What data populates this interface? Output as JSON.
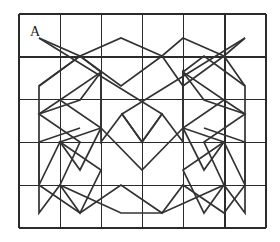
{
  "figure": {
    "type": "geometric-star-tessellation",
    "label_a": "A",
    "colors": {
      "grid": "#2b2b2b",
      "path": "#333333",
      "background": "#ffffff",
      "label": "#1a1a1a"
    },
    "grid": {
      "columns": 6,
      "rows": 5,
      "x0": 19,
      "y0": 14,
      "x1": 266,
      "y1": 228,
      "cell_width": 41.17,
      "cell_height": 42.8,
      "x_lines": [
        19,
        60.2,
        101.3,
        142.5,
        183.7,
        224.8,
        266
      ],
      "y_lines": [
        14,
        56.8,
        99.6,
        142.4,
        185.2,
        228
      ]
    },
    "label_a_position": {
      "x": 30,
      "y": 36
    },
    "paths": [
      {
        "name": "outer-zigzag-band-upper",
        "points": "39,38 101,72 142,56 183,72 245,38 245,86 204,100 245,114 224,142 204,128 204,170 163,142 142,170 121,142 80,170 80,128 60,142 39,114 80,100 39,86"
      }
    ],
    "polylines": [
      {
        "name": "stroke-1",
        "points": [
          [
            39,
            38
          ],
          [
            162,
            114
          ],
          [
            142,
            142
          ],
          [
            122,
            114
          ],
          [
            101,
            142
          ],
          [
            101,
            72
          ],
          [
            60,
            100
          ],
          [
            101,
            128
          ],
          [
            80,
            170
          ],
          [
            60,
            142
          ],
          [
            39,
            185
          ],
          [
            39,
            86
          ],
          [
            80,
            56
          ],
          [
            101,
            72
          ]
        ]
      },
      {
        "name": "stroke-2",
        "points": [
          [
            245,
            38
          ],
          [
            122,
            114
          ],
          [
            142,
            142
          ],
          [
            162,
            114
          ],
          [
            183,
            142
          ],
          [
            183,
            72
          ],
          [
            224,
            100
          ],
          [
            183,
            128
          ],
          [
            204,
            170
          ],
          [
            224,
            142
          ],
          [
            245,
            185
          ],
          [
            245,
            86
          ],
          [
            204,
            56
          ],
          [
            183,
            72
          ]
        ]
      },
      {
        "name": "stroke-3",
        "points": [
          [
            39,
            38
          ],
          [
            80,
            56
          ],
          [
            121,
            38
          ],
          [
            162,
            56
          ],
          [
            183,
            38
          ],
          [
            224,
            56
          ],
          [
            245,
            38
          ]
        ]
      },
      {
        "name": "stroke-4",
        "points": [
          [
            39,
            86
          ],
          [
            80,
            56
          ],
          [
            121,
            86
          ],
          [
            162,
            56
          ],
          [
            183,
            86
          ],
          [
            224,
            56
          ],
          [
            245,
            86
          ]
        ]
      },
      {
        "name": "stroke-5",
        "points": [
          [
            39,
            185
          ],
          [
            80,
            213
          ],
          [
            121,
            185
          ],
          [
            162,
            213
          ],
          [
            183,
            185
          ],
          [
            224,
            213
          ],
          [
            245,
            185
          ]
        ]
      },
      {
        "name": "stroke-6",
        "points": [
          [
            39,
            114
          ],
          [
            80,
            100
          ],
          [
            101,
            72
          ],
          [
            101,
            128
          ],
          [
            60,
            142
          ],
          [
            101,
            170
          ],
          [
            80,
            213
          ],
          [
            60,
            185
          ],
          [
            39,
            213
          ],
          [
            39,
            142
          ],
          [
            80,
            128
          ]
        ]
      },
      {
        "name": "stroke-7",
        "points": [
          [
            245,
            114
          ],
          [
            204,
            100
          ],
          [
            183,
            72
          ],
          [
            183,
            128
          ],
          [
            224,
            142
          ],
          [
            183,
            170
          ],
          [
            204,
            213
          ],
          [
            224,
            185
          ],
          [
            245,
            213
          ],
          [
            245,
            142
          ],
          [
            204,
            128
          ]
        ]
      },
      {
        "name": "stroke-8",
        "points": [
          [
            101,
            128
          ],
          [
            142,
            170
          ],
          [
            183,
            128
          ]
        ]
      },
      {
        "name": "stroke-9",
        "points": [
          [
            60,
            100
          ],
          [
            39,
            114
          ],
          [
            80,
            142
          ],
          [
            60,
            185
          ],
          [
            121,
            213
          ],
          [
            162,
            213
          ],
          [
            224,
            185
          ],
          [
            204,
            142
          ],
          [
            245,
            114
          ],
          [
            224,
            100
          ]
        ]
      }
    ]
  }
}
